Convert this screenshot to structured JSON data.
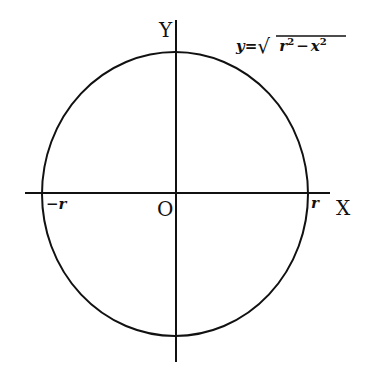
{
  "diagram": {
    "type": "circle-on-cartesian-axes",
    "axes": {
      "x_label": "X",
      "y_label": "Y",
      "origin_label": "O"
    },
    "ticks": {
      "negative_r": "−r",
      "positive_r": "r"
    },
    "equation": {
      "lhs": "y",
      "eq": "=",
      "radical": "√",
      "radicand_a": "r",
      "radicand_a_exp": "2",
      "minus": "−",
      "radicand_b": "x",
      "radicand_b_exp": "2"
    },
    "colors": {
      "stroke": "#111111",
      "background": "#ffffff"
    }
  }
}
